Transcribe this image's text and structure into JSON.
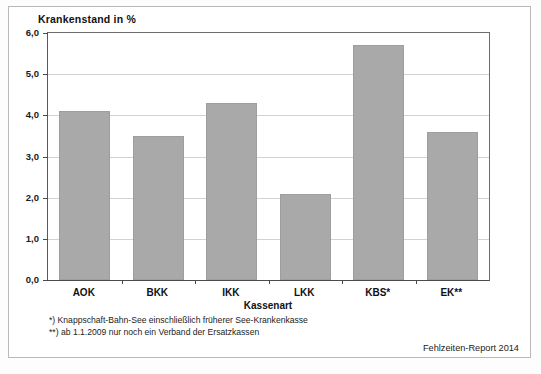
{
  "chart_data": {
    "type": "bar",
    "title": "Krankenstand in %",
    "xlabel": "Kassenart",
    "ylabel": "Krankenstand in %",
    "categories": [
      "AOK",
      "BKK",
      "IKK",
      "LKK",
      "KBS*",
      "EK**"
    ],
    "values": [
      4.1,
      3.5,
      4.3,
      2.1,
      5.7,
      3.6
    ],
    "ylim": [
      0.0,
      6.0
    ],
    "ytick_labels": [
      "0,0",
      "1,0",
      "2,0",
      "3,0",
      "4,0",
      "5,0",
      "6,0"
    ],
    "ytick_values": [
      0.0,
      1.0,
      2.0,
      3.0,
      4.0,
      5.0,
      6.0
    ],
    "grid": true,
    "legend": "none",
    "bar_color": "#a9a9a9",
    "annotations": [
      "*) Knappschaft-Bahn-See einschließlich früherer See-Krankenkasse",
      "**) ab 1.1.2009 nur noch ein Verband der Ersatzkassen"
    ],
    "source": "Fehlzeiten-Report 2014"
  },
  "figure": {
    "title": "Krankenstand in %",
    "axis_title_x": "Kassenart",
    "footnote_1": "*) Knappschaft-Bahn-See einschließlich früherer See-Krankenkasse",
    "footnote_2": "**) ab 1.1.2009 nur noch ein Verband der Ersatzkassen",
    "source": "Fehlzeiten-Report 2014"
  }
}
